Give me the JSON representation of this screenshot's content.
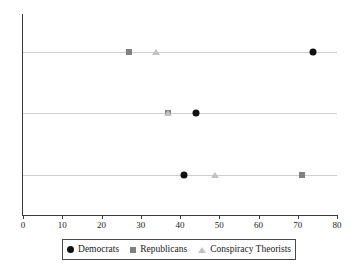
{
  "chart_data": {
    "type": "scatter",
    "title": "",
    "xlabel": "",
    "ylabel": "",
    "xlim": [
      0,
      82
    ],
    "xticks": [
      0,
      10,
      20,
      30,
      40,
      50,
      60,
      70,
      80
    ],
    "categories": [
      "Democrats",
      "Independents",
      "Republicans"
    ],
    "grid": "horizontal-category-lines",
    "legend_position": "bottom",
    "series": [
      {
        "name": "Democrats",
        "marker": "circle",
        "color": "#111111",
        "values": [
          74,
          44,
          41
        ]
      },
      {
        "name": "Republicans",
        "marker": "square",
        "color": "#808080",
        "values": [
          27,
          37,
          71
        ]
      },
      {
        "name": "Conspiracy Theorists",
        "marker": "triangle",
        "color": "#c2c2c2",
        "values": [
          34,
          37,
          49
        ]
      }
    ],
    "points": [
      {
        "category": "Democrats",
        "series": "Republicans",
        "x": 27
      },
      {
        "category": "Democrats",
        "series": "Conspiracy Theorists",
        "x": 34
      },
      {
        "category": "Democrats",
        "series": "Democrats",
        "x": 74
      },
      {
        "category": "Independents",
        "series": "Republicans",
        "x": 37
      },
      {
        "category": "Independents",
        "series": "Conspiracy Theorists",
        "x": 37
      },
      {
        "category": "Independents",
        "series": "Democrats",
        "x": 44
      },
      {
        "category": "Republicans",
        "series": "Democrats",
        "x": 41
      },
      {
        "category": "Republicans",
        "series": "Conspiracy Theorists",
        "x": 49
      },
      {
        "category": "Republicans",
        "series": "Republicans",
        "x": 71
      }
    ]
  },
  "axis": {
    "x_tick_labels": [
      "0",
      "10",
      "20",
      "30",
      "40",
      "50",
      "60",
      "70",
      "80"
    ],
    "y_category_labels": [
      "Democrats",
      "Independents",
      "Republicans"
    ]
  },
  "legend": {
    "items": [
      {
        "label": "Democrats",
        "marker": "circle-marker-icon"
      },
      {
        "label": "Republicans",
        "marker": "square-marker-icon"
      },
      {
        "label": "Conspiracy Theorists",
        "marker": "triangle-marker-icon"
      }
    ]
  }
}
